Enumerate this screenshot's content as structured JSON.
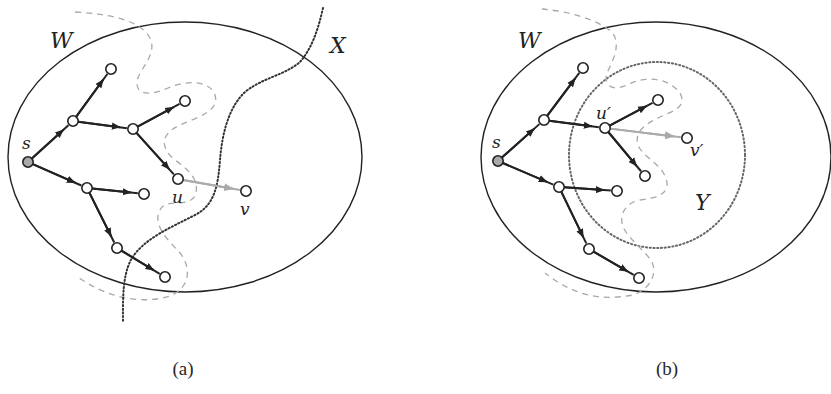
{
  "figure": {
    "colors": {
      "ink": "#222222",
      "node_fill": "#ffffff",
      "gray_edge": "#aaaaaa",
      "dashed_cut": "#a8a8a8",
      "dotted": "#333333",
      "dotted_y": "#666666"
    },
    "panels": [
      {
        "id": "a",
        "caption": "(a)",
        "caption_pos": [
          183,
          375
        ],
        "set_labels": [
          {
            "text": "W",
            "pos": [
              50,
              48
            ]
          },
          {
            "text": "X",
            "pos": [
              330,
              53
            ]
          }
        ],
        "ellipse_W": {
          "cx": 185,
          "cy": 157,
          "rx": 177,
          "ry": 135
        },
        "nodes": [
          {
            "id": "s",
            "label": "s",
            "pos": [
              28,
              162
            ],
            "label_pos": [
              22,
              149
            ],
            "fill": "#aaaaaa"
          },
          {
            "id": "a1",
            "pos": [
              73,
              121
            ]
          },
          {
            "id": "a2",
            "pos": [
              111,
              69
            ]
          },
          {
            "id": "b1",
            "pos": [
              133,
              129
            ]
          },
          {
            "id": "b2",
            "pos": [
              185,
              101
            ]
          },
          {
            "id": "u",
            "label": "u",
            "pos": [
              178,
              179
            ],
            "label_pos": [
              172,
              203
            ]
          },
          {
            "id": "v",
            "label": "v",
            "pos": [
              246,
              191
            ],
            "label_pos": [
              240,
              215
            ]
          },
          {
            "id": "c1",
            "pos": [
              87,
              188
            ]
          },
          {
            "id": "c2",
            "pos": [
              144,
              194
            ]
          },
          {
            "id": "d1",
            "pos": [
              117,
              248
            ]
          },
          {
            "id": "d2",
            "pos": [
              165,
              277
            ]
          }
        ],
        "edges": [
          {
            "from": "s",
            "to": "a1"
          },
          {
            "from": "a1",
            "to": "a2"
          },
          {
            "from": "a1",
            "to": "b1"
          },
          {
            "from": "b1",
            "to": "b2"
          },
          {
            "from": "b1",
            "to": "u"
          },
          {
            "from": "s",
            "to": "c1"
          },
          {
            "from": "c1",
            "to": "c2"
          },
          {
            "from": "c1",
            "to": "d1"
          },
          {
            "from": "d1",
            "to": "d2"
          }
        ],
        "gray_edges": [
          {
            "from": "u",
            "to": "v"
          }
        ],
        "dashed_path": "M 75 12 C 110 14 140 20 150 38 C 158 55 138 70 137 82 C 136 95 150 96 168 88 C 185 80 210 80 215 95 C 220 112 195 118 180 125 C 160 134 160 148 175 160 C 192 172 200 182 195 196 C 188 208 165 198 160 210 C 152 225 168 240 180 253 C 192 268 190 288 170 296 C 145 304 110 300 78 277",
        "dotted_path": "M 323 8 C 318 30 312 48 300 62 C 285 75 262 78 245 92 C 228 108 222 135 220 160 C 218 185 215 205 195 215 C 170 228 145 238 132 258 C 122 275 123 300 123 322",
        "dotted_circle": null
      },
      {
        "id": "b",
        "caption": "(b)",
        "caption_pos": [
          667,
          375
        ],
        "set_labels": [
          {
            "text": "W",
            "pos": [
              518,
              48
            ]
          },
          {
            "text": "Y",
            "pos": [
              695,
              210
            ]
          }
        ],
        "ellipse_W": {
          "cx": 656,
          "cy": 157,
          "rx": 175,
          "ry": 135
        },
        "nodes": [
          {
            "id": "s",
            "label": "s",
            "pos": [
              498,
              161
            ],
            "label_pos": [
              492,
              148
            ],
            "fill": "#aaaaaa"
          },
          {
            "id": "a1",
            "pos": [
              544,
              120
            ]
          },
          {
            "id": "a2",
            "pos": [
              583,
              68
            ]
          },
          {
            "id": "u",
            "label": "u′",
            "pos": [
              605,
              128
            ],
            "label_pos": [
              596,
              119
            ]
          },
          {
            "id": "b2",
            "pos": [
              658,
              100
            ]
          },
          {
            "id": "b3",
            "pos": [
              645,
              176
            ]
          },
          {
            "id": "v",
            "label": "v′",
            "pos": [
              687,
              138
            ],
            "label_pos": [
              690,
              156
            ]
          },
          {
            "id": "c1",
            "pos": [
              559,
              187
            ]
          },
          {
            "id": "c2",
            "pos": [
              617,
              191
            ]
          },
          {
            "id": "d1",
            "pos": [
              589,
              249
            ]
          },
          {
            "id": "d2",
            "pos": [
              639,
              278
            ]
          }
        ],
        "edges": [
          {
            "from": "s",
            "to": "a1"
          },
          {
            "from": "a1",
            "to": "a2"
          },
          {
            "from": "a1",
            "to": "u"
          },
          {
            "from": "u",
            "to": "b2"
          },
          {
            "from": "u",
            "to": "b3"
          },
          {
            "from": "s",
            "to": "c1"
          },
          {
            "from": "c1",
            "to": "c2"
          },
          {
            "from": "c1",
            "to": "d1"
          },
          {
            "from": "d1",
            "to": "d2"
          }
        ],
        "gray_edges": [
          {
            "from": "u",
            "to": "v"
          }
        ],
        "dashed_path": "M 542 9 C 565 11 595 18 612 32 C 622 45 612 62 607 73 C 603 85 612 92 627 85 C 640 78 665 74 680 93 C 688 108 670 112 660 117 C 645 124 634 132 638 145 C 643 158 665 165 667 183 C 668 195 655 198 640 200 C 628 202 620 212 622 223 C 624 236 645 250 652 262 C 658 276 648 290 633 295 C 600 301 575 296 545 273",
        "dotted_path": null,
        "dotted_circle": {
          "cx": 657,
          "cy": 155,
          "rx": 88,
          "ry": 93
        }
      }
    ]
  }
}
